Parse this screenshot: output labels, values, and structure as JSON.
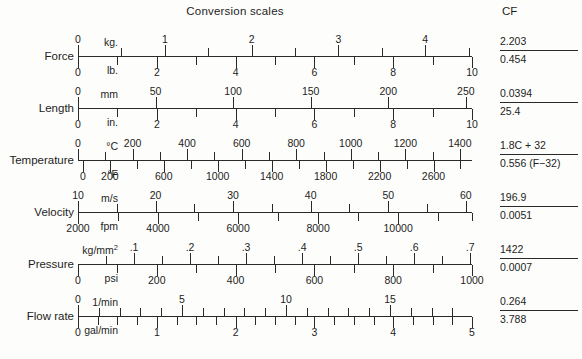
{
  "title": "Conversion scales",
  "cf_header": "CF",
  "chart_data": {
    "type": "table",
    "title": "Conversion scales",
    "columns": [
      "quantity",
      "metric unit",
      "metric ticks",
      "imperial unit",
      "imperial ticks",
      "CF numerator",
      "CF denominator"
    ],
    "rows": [
      {
        "quantity": "Force",
        "top_unit": "kg.",
        "top_values": [
          0,
          1,
          2,
          3,
          4
        ],
        "bot_unit": "lb.",
        "bot_values": [
          0,
          2,
          4,
          6,
          8,
          10
        ],
        "cf_num": "2.203",
        "cf_den": "0.454"
      },
      {
        "quantity": "Length",
        "top_unit": "mm",
        "top_values": [
          0,
          50,
          100,
          150,
          200,
          250
        ],
        "bot_unit": "in.",
        "bot_values": [
          0,
          2,
          4,
          6,
          8,
          10
        ],
        "cf_num": "0.0394",
        "cf_den": "25.4"
      },
      {
        "quantity": "Temperature",
        "top_unit": "°C",
        "top_values": [
          0,
          200,
          400,
          600,
          800,
          1000,
          1200,
          1400
        ],
        "bot_unit": "°F",
        "bot_values": [
          0,
          200,
          600,
          1000,
          1400,
          1800,
          2200,
          2600
        ],
        "cf_num": "1.8C + 32",
        "cf_den": "0.556 (F−32)"
      },
      {
        "quantity": "Velocity",
        "top_unit": "m/s",
        "top_values": [
          10,
          20,
          30,
          40,
          50,
          60
        ],
        "bot_unit": "fpm",
        "bot_values": [
          2000,
          4000,
          6000,
          8000,
          10000
        ],
        "cf_num": "196.9",
        "cf_den": "0.0051"
      },
      {
        "quantity": "Pressure",
        "top_unit": "kg/mm2",
        "top_values": [
          ".1",
          ".2",
          ".3",
          ".4",
          ".5",
          ".6",
          ".7"
        ],
        "bot_unit": "psi",
        "bot_values": [
          0,
          200,
          400,
          600,
          800,
          1000
        ],
        "cf_num": "1422",
        "cf_den": "0.0007"
      },
      {
        "quantity": "Flow rate",
        "top_unit": "1/min",
        "top_values": [
          0,
          5,
          10,
          15
        ],
        "bot_unit": "gal/min",
        "bot_values": [
          0,
          1,
          2,
          3,
          4,
          5
        ],
        "cf_num": "0.264",
        "cf_den": "3.788"
      }
    ]
  },
  "rows": [
    {
      "label": "Force",
      "top": {
        "unit": "kg.",
        "labels": [
          {
            "text": "0",
            "pos": 0.0
          },
          {
            "text": "1",
            "pos": 0.2203
          },
          {
            "text": "2",
            "pos": 0.4406
          },
          {
            "text": "3",
            "pos": 0.6609
          },
          {
            "text": "4",
            "pos": 0.8812
          }
        ],
        "ticks": [
          0.0,
          0.11015,
          0.2203,
          0.33045,
          0.4406,
          0.55075,
          0.6609,
          0.77105,
          0.8812,
          0.99135
        ],
        "majors": [
          0.0,
          0.2203,
          0.4406,
          0.6609,
          0.8812
        ]
      },
      "bot": {
        "unit": "lb.",
        "labels": [
          {
            "text": "0",
            "pos": 0.0
          },
          {
            "text": "2",
            "pos": 0.2
          },
          {
            "text": "4",
            "pos": 0.4
          },
          {
            "text": "6",
            "pos": 0.6
          },
          {
            "text": "8",
            "pos": 0.8
          },
          {
            "text": "10",
            "pos": 1.0
          }
        ],
        "ticks": [
          0.0,
          0.1,
          0.2,
          0.3,
          0.4,
          0.5,
          0.6,
          0.7,
          0.8,
          0.9,
          1.0
        ],
        "majors": [
          0.0,
          0.2,
          0.4,
          0.6,
          0.8,
          1.0
        ]
      },
      "cf_num": "2.203",
      "cf_den": "0.454"
    },
    {
      "label": "Length",
      "top": {
        "unit": "mm",
        "labels": [
          {
            "text": "0",
            "pos": 0.0
          },
          {
            "text": "50",
            "pos": 0.1969
          },
          {
            "text": "100",
            "pos": 0.3937
          },
          {
            "text": "150",
            "pos": 0.5906
          },
          {
            "text": "200",
            "pos": 0.7874
          },
          {
            "text": "250",
            "pos": 0.9843
          }
        ],
        "ticks": [
          0.0,
          0.1969,
          0.3937,
          0.5906,
          0.7874,
          0.9843
        ],
        "majors": [
          0.0,
          0.1969,
          0.3937,
          0.5906,
          0.7874,
          0.9843
        ]
      },
      "bot": {
        "unit": "in.",
        "labels": [
          {
            "text": "0",
            "pos": 0.0
          },
          {
            "text": "2",
            "pos": 0.2
          },
          {
            "text": "4",
            "pos": 0.4
          },
          {
            "text": "6",
            "pos": 0.6
          },
          {
            "text": "8",
            "pos": 0.8
          },
          {
            "text": "10",
            "pos": 1.0
          }
        ],
        "ticks": [
          0.0,
          0.1,
          0.2,
          0.3,
          0.4,
          0.5,
          0.6,
          0.7,
          0.8,
          0.9,
          1.0
        ],
        "majors": [
          0.0,
          0.2,
          0.4,
          0.6,
          0.8,
          1.0
        ]
      },
      "cf_num": "0.0394",
      "cf_den": "25.4"
    },
    {
      "label": "Temperature",
      "top": {
        "unit": "°C",
        "labels": [
          {
            "text": "0",
            "pos": 0.0
          },
          {
            "text": "200",
            "pos": 0.1385
          },
          {
            "text": "400",
            "pos": 0.2769
          },
          {
            "text": "600",
            "pos": 0.4154
          },
          {
            "text": "800",
            "pos": 0.5538
          },
          {
            "text": "1000",
            "pos": 0.6923
          },
          {
            "text": "1200",
            "pos": 0.8308
          },
          {
            "text": "1400",
            "pos": 0.9692
          }
        ],
        "ticks": [
          0.0,
          0.0692,
          0.1385,
          0.2077,
          0.2769,
          0.3462,
          0.4154,
          0.4846,
          0.5538,
          0.6231,
          0.6923,
          0.7615,
          0.8308,
          0.9,
          0.9692
        ],
        "majors": [
          0.0,
          0.1385,
          0.2769,
          0.4154,
          0.5538,
          0.6923,
          0.8308,
          0.9692
        ]
      },
      "bot": {
        "unit": "°F",
        "labels": [
          {
            "text": "0",
            "pos": 0.0123
          },
          {
            "text": "200",
            "pos": 0.0808
          },
          {
            "text": "600",
            "pos": 0.2177
          },
          {
            "text": "1000",
            "pos": 0.3546
          },
          {
            "text": "1400",
            "pos": 0.4915
          },
          {
            "text": "1800",
            "pos": 0.6285
          },
          {
            "text": "2200",
            "pos": 0.7654
          },
          {
            "text": "2600",
            "pos": 0.9023
          }
        ],
        "ticks": [
          0.0123,
          0.0808,
          0.1492,
          0.2177,
          0.2861,
          0.3546,
          0.4231,
          0.4915,
          0.56,
          0.6285,
          0.6969,
          0.7654,
          0.8338,
          0.9023,
          0.9708
        ],
        "majors": [
          0.0123,
          0.0808,
          0.2177,
          0.3546,
          0.4915,
          0.6285,
          0.7654,
          0.9023
        ]
      },
      "cf_num": "1.8C + 32",
      "cf_den": "0.556 (F−32)"
    },
    {
      "label": "Velocity",
      "top": {
        "unit": "m/s",
        "labels": [
          {
            "text": "10",
            "pos": 0.0
          },
          {
            "text": "20",
            "pos": 0.1969
          },
          {
            "text": "30",
            "pos": 0.3937
          },
          {
            "text": "40",
            "pos": 0.5906
          },
          {
            "text": "50",
            "pos": 0.7874
          },
          {
            "text": "60",
            "pos": 0.9843
          }
        ],
        "ticks": [
          0.0,
          0.0984,
          0.1969,
          0.2953,
          0.3937,
          0.4921,
          0.5906,
          0.689,
          0.7874,
          0.8858,
          0.9843
        ],
        "majors": [
          0.0,
          0.1969,
          0.3937,
          0.5906,
          0.7874,
          0.9843
        ]
      },
      "bot": {
        "unit": "fpm",
        "labels": [
          {
            "text": "2000",
            "pos": 0.0
          },
          {
            "text": "4000",
            "pos": 0.2031
          },
          {
            "text": "6000",
            "pos": 0.4063
          },
          {
            "text": "8000",
            "pos": 0.6094
          },
          {
            "text": "10000",
            "pos": 0.8125
          }
        ],
        "ticks": [
          0.0,
          0.1016,
          0.2031,
          0.3047,
          0.4063,
          0.5078,
          0.6094,
          0.7109,
          0.8125,
          0.9141,
          1.0
        ],
        "majors": [
          0.0,
          0.2031,
          0.4063,
          0.6094,
          0.8125
        ]
      },
      "cf_num": "196.9",
      "cf_den": "0.0051"
    },
    {
      "label": "Pressure",
      "top": {
        "unit": "kg/mm<sup>2</sup>",
        "labels": [
          {
            "text": ".1",
            "pos": 0.1422
          },
          {
            "text": ".2",
            "pos": 0.2844
          },
          {
            "text": ".3",
            "pos": 0.4266
          },
          {
            "text": ".4",
            "pos": 0.5688
          },
          {
            "text": ".5",
            "pos": 0.711
          },
          {
            "text": ".6",
            "pos": 0.8532
          },
          {
            "text": ".7",
            "pos": 0.9954
          }
        ],
        "ticks": [
          0.0711,
          0.1422,
          0.2133,
          0.2844,
          0.3555,
          0.4266,
          0.4977,
          0.5688,
          0.6399,
          0.711,
          0.7821,
          0.8532,
          0.9243,
          0.9954
        ],
        "majors": [
          0.1422,
          0.2844,
          0.4266,
          0.5688,
          0.711,
          0.8532,
          0.9954
        ]
      },
      "bot": {
        "unit": "psi",
        "labels": [
          {
            "text": "0",
            "pos": 0.0
          },
          {
            "text": "200",
            "pos": 0.2
          },
          {
            "text": "400",
            "pos": 0.4
          },
          {
            "text": "600",
            "pos": 0.6
          },
          {
            "text": "800",
            "pos": 0.8
          },
          {
            "text": "1000",
            "pos": 1.0
          }
        ],
        "ticks": [
          0.0,
          0.1,
          0.2,
          0.3,
          0.4,
          0.5,
          0.6,
          0.7,
          0.8,
          0.9,
          1.0
        ],
        "majors": [
          0.0,
          0.2,
          0.4,
          0.6,
          0.8,
          1.0
        ]
      },
      "cf_num": "1422",
      "cf_den": "0.0007"
    },
    {
      "label": "Flow rate",
      "top": {
        "unit": "1/min",
        "labels": [
          {
            "text": "0",
            "pos": 0.0
          },
          {
            "text": "5",
            "pos": 0.264
          },
          {
            "text": "10",
            "pos": 0.528
          },
          {
            "text": "15",
            "pos": 0.792
          }
        ],
        "ticks": [
          0.0,
          0.0528,
          0.1056,
          0.1584,
          0.2112,
          0.264,
          0.3168,
          0.3696,
          0.4224,
          0.4752,
          0.528,
          0.5808,
          0.6336,
          0.6864,
          0.7392,
          0.792,
          0.8448,
          0.8976,
          0.9504
        ],
        "majors": [
          0.0,
          0.264,
          0.528,
          0.792
        ]
      },
      "bot": {
        "unit": "gal/min",
        "labels": [
          {
            "text": "0",
            "pos": 0.0
          },
          {
            "text": "1",
            "pos": 0.2
          },
          {
            "text": "2",
            "pos": 0.4
          },
          {
            "text": "3",
            "pos": 0.6
          },
          {
            "text": "4",
            "pos": 0.8
          },
          {
            "text": "5",
            "pos": 1.0
          }
        ],
        "ticks": [
          0.0,
          0.05,
          0.1,
          0.15,
          0.2,
          0.25,
          0.3,
          0.35,
          0.4,
          0.45,
          0.5,
          0.55,
          0.6,
          0.65,
          0.7,
          0.75,
          0.8,
          0.85,
          0.9,
          0.95,
          1.0
        ],
        "majors": [
          0.0,
          0.2,
          0.4,
          0.6,
          0.8,
          1.0
        ]
      },
      "cf_num": "0.264",
      "cf_den": "3.788"
    }
  ]
}
